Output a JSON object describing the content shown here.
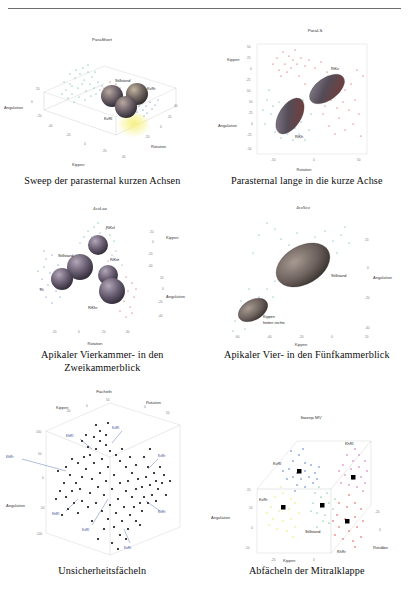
{
  "page": {
    "background": "#ffffff",
    "divider_color": "#6f6f6f"
  },
  "figures": [
    {
      "id": "fig-parashort",
      "title": "ParaShort",
      "caption": "Sweep der parasternal kurzen Achsen",
      "axes": {
        "x": "Kippen",
        "y": "Rotation",
        "z": "Angulation"
      },
      "ticks": {
        "left": [
          "20",
          "0",
          "-20",
          "-40"
        ],
        "bottom_left": [
          "-20",
          "0",
          "20",
          "40"
        ],
        "bottom_right": [
          "-20",
          "0",
          "20",
          "40"
        ]
      },
      "cluster_labels": [
        "Stillstand",
        "KvRr",
        "KvRl"
      ],
      "cluster_colors": [
        "#2aa198",
        "#2f6fb5",
        "#c8302e",
        "#e8e23a"
      ],
      "style": "3d-scatter-ellipsoids"
    },
    {
      "id": "fig-parals",
      "title": "ParaLS",
      "caption": "Parasternal lange in die kurze Achse",
      "axes": {
        "x": "Rotation",
        "y": "Angulation",
        "z": "Kippen"
      },
      "ticks": {
        "left": [
          "50",
          "25",
          "0",
          "-25",
          "-50",
          "50",
          "25",
          "0",
          "-25",
          "-50"
        ],
        "bottom": [
          "-50",
          "0",
          "50"
        ]
      },
      "cluster_labels": [
        "RiKv",
        "RiKh"
      ],
      "cluster_colors": [
        "#cf2b24",
        "#2aa198"
      ],
      "style": "3d-scatter-ellipsoids"
    },
    {
      "id": "fig-4cvlax",
      "title": "4cvLax",
      "caption": "Apikaler Vierkammer- in den Zweikammerblick",
      "axes": {
        "x": "Rotation",
        "y": "Angulation",
        "z": "Kippen"
      },
      "ticks": {
        "right": [
          "20",
          "0",
          "-20",
          "-40",
          "20",
          "0",
          "-20",
          "-40"
        ],
        "bottom": [
          "-20",
          "0",
          "20",
          "40"
        ]
      },
      "cluster_labels": [
        "RiKvl",
        "Stillstand",
        "RiKvr",
        "Ri",
        "RiKhr"
      ],
      "cluster_colors": [
        "#2f6fb5",
        "#2aa198",
        "#c8302e",
        "#8a6fbe"
      ],
      "style": "3d-scatter-ellipsoids"
    },
    {
      "id": "fig-4cv5cv",
      "title": "4cv5cv",
      "caption": "Apikaler Vier- in den Fünfkammerblick",
      "axes": {
        "x": "Kippen",
        "y": "Angulation"
      },
      "ticks": {
        "right": [
          "20",
          "0",
          "-20",
          "-40"
        ],
        "bottom": [
          "-60",
          "-40",
          "-20",
          "0",
          "20"
        ]
      },
      "cluster_labels": [
        "Stillstand",
        "Kippen",
        "hinten rechts"
      ],
      "cluster_colors": [
        "#2aa198",
        "#8f7b6a"
      ],
      "style": "3d-scatter-ellipsoids"
    },
    {
      "id": "fig-faecheln",
      "title": "Fächeln",
      "caption": "Unsicherheitsfächeln",
      "axes": {
        "x": "Kippen",
        "y": "Rotation",
        "z": "Angulation"
      },
      "ticks": {
        "top_left": [
          "-50",
          "0",
          "50"
        ],
        "top_right": [
          "0",
          "50"
        ],
        "left": [
          "-100",
          "-50",
          "0",
          "50",
          "100"
        ]
      },
      "annotation_labels": [
        "KvRl",
        "KhRl",
        "KhRr",
        "KvRr",
        "KhRl",
        "KvRl",
        "KhRr",
        "KvRr",
        "KhRr"
      ],
      "annotation_color": "#1f3f8f",
      "point_color": "#000000",
      "style": "3d-scatter-cloud"
    },
    {
      "id": "fig-sweep-mv",
      "title": "Sweep MV",
      "caption": "Abfächeln der Mitralklappe",
      "axes": {
        "x": "Kippen",
        "y": "Rotation",
        "z": "Angulation"
      },
      "ticks": {
        "left": [
          "20",
          "10",
          "0",
          "-10"
        ],
        "bottom_left": [
          "-20",
          "0"
        ],
        "right": [
          "-20",
          "0",
          "20"
        ]
      },
      "cluster_labels": [
        "KvRl",
        "KhRl",
        "KvRr",
        "Stillstand",
        "KhRr"
      ],
      "cluster_colors": {
        "KvRl": "#1f4fc0",
        "KhRl": "#c13fa8",
        "KvRr": "#e8e23a",
        "Stillstand": "#159c48",
        "KhRr": "#e02020"
      },
      "style": "3d-scatter-clusters"
    }
  ]
}
